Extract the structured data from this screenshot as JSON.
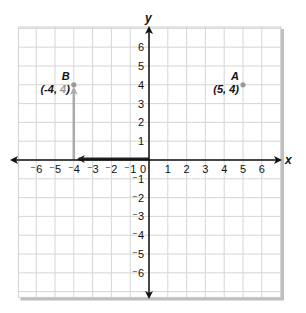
{
  "diagram": {
    "type": "coordinate-plane",
    "x_axis_label": "x",
    "y_axis_label": "y",
    "x_range": [
      -6,
      6
    ],
    "y_range": [
      -6,
      6
    ],
    "x_ticks": [
      {
        "value": -6,
        "label": "⁻6"
      },
      {
        "value": -5,
        "label": "⁻5"
      },
      {
        "value": -4,
        "label": "⁻4"
      },
      {
        "value": -3,
        "label": "⁻3"
      },
      {
        "value": -2,
        "label": "⁻2"
      },
      {
        "value": -1,
        "label": "⁻1"
      },
      {
        "value": 0,
        "label": "0"
      },
      {
        "value": 1,
        "label": "1"
      },
      {
        "value": 2,
        "label": "2"
      },
      {
        "value": 3,
        "label": "3"
      },
      {
        "value": 4,
        "label": "4"
      },
      {
        "value": 5,
        "label": "5"
      },
      {
        "value": 6,
        "label": "6"
      }
    ],
    "y_ticks": [
      {
        "value": 6,
        "label": "6"
      },
      {
        "value": 5,
        "label": "5"
      },
      {
        "value": 4,
        "label": "4"
      },
      {
        "value": 3,
        "label": "3"
      },
      {
        "value": 2,
        "label": "2"
      },
      {
        "value": 1,
        "label": "1"
      },
      {
        "value": -1,
        "label": "⁻1"
      },
      {
        "value": -2,
        "label": "⁻2"
      },
      {
        "value": -3,
        "label": "⁻3"
      },
      {
        "value": -4,
        "label": "⁻4"
      },
      {
        "value": -5,
        "label": "⁻5"
      },
      {
        "value": -6,
        "label": "⁻6"
      }
    ],
    "points": [
      {
        "name": "A",
        "x": 5,
        "y": 4,
        "coord_label": "(5, 4)",
        "color": "#999999"
      },
      {
        "name": "B",
        "x": -4,
        "y": 4,
        "coord_label_prefix": "(-4, ",
        "coord_label_highlight": "4",
        "coord_label_suffix": ")",
        "color": "#999999"
      }
    ],
    "path_arrows": [
      {
        "from": [
          0,
          0
        ],
        "to": [
          -4,
          0
        ],
        "color": "#222222",
        "label": "horizontal move"
      },
      {
        "from": [
          -4,
          0
        ],
        "to": [
          -4,
          4
        ],
        "color": "#aaaaaa",
        "label": "vertical move"
      }
    ],
    "colors": {
      "grid": "#d6d6d6",
      "axis": "#111111",
      "border_shadow": "#bfbfbf",
      "highlight_text": "#9a9a9a"
    }
  }
}
